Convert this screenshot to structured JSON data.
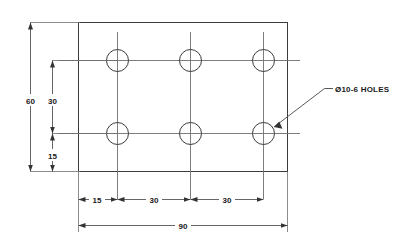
{
  "drawing": {
    "title": "Rectangular plate with six holes",
    "view": "front-view",
    "units_note": "",
    "colors": {
      "background": "#ffffff",
      "object_line": "#3c3c3c",
      "center_line": "#6e6e6e",
      "dimension_line": "#555555",
      "text": "#1a1a1a"
    },
    "plate": {
      "name": "plate-outline",
      "width_value": "90",
      "height_value": "60"
    },
    "holes": {
      "note": "Ø10-6 HOLES",
      "diameter": "10",
      "count": "6",
      "rows": 2,
      "columns": 3
    },
    "dimensions": {
      "overall_width": "90",
      "overall_height": "60",
      "vertical": [
        {
          "name": "dim-overall-height",
          "label": "60"
        },
        {
          "name": "dim-hole-row-spacing",
          "label": "30"
        },
        {
          "name": "dim-bottom-row-offset",
          "label": "15"
        }
      ],
      "horizontal_chain": [
        {
          "name": "dim-left-edge-to-first-hole",
          "label": "15"
        },
        {
          "name": "dim-hole-spacing-1",
          "label": "30"
        },
        {
          "name": "dim-hole-spacing-2",
          "label": "30"
        }
      ],
      "horizontal_overall": {
        "name": "dim-overall-width",
        "label": "90"
      }
    },
    "labels": {
      "dim_60": "60",
      "dim_30_vertical": "30",
      "dim_15_vertical": "15",
      "dim_15_horizontal": "15",
      "dim_30_horizontal_a": "30",
      "dim_30_horizontal_b": "30",
      "dim_90": "90",
      "hole_note": "Ø10-6 HOLES"
    }
  }
}
